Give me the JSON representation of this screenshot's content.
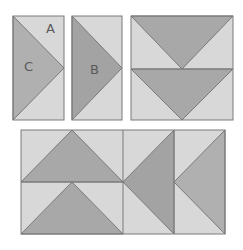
{
  "colors": {
    "light": "#d8d8d8",
    "dark_c": "#b0b0b0",
    "dark_b": "#a3a3a3",
    "dark_block": "#a8a8a8",
    "edge": "#7a7a7a"
  },
  "labels": {
    "a": "A",
    "b": "B",
    "c": "C"
  },
  "pieces": [
    {
      "id": "flying-geese-ac",
      "description": "Rectangle split into dark triangle C and light corner triangles A"
    },
    {
      "id": "flying-geese-b",
      "description": "Rectangle with dark triangle B"
    },
    {
      "id": "two-geese-unit",
      "description": "Two stacked flying-geese units pointing down"
    },
    {
      "id": "assembled-block",
      "description": "Assembled block of flying-geese units"
    }
  ]
}
